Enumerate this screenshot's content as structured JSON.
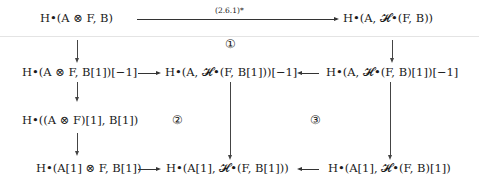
{
  "diagram": {
    "type": "commutative-diagram",
    "nodes": {
      "top_left": "H•(A ⊗ F, B)",
      "top_right": "H•(A, 𝓗•(F, B))",
      "mid_left": "H•(A ⊗ F, B[1])[−1]",
      "mid_center": "H•(A, 𝓗•(F, B[1]))[−1]",
      "mid_right": "H•(A, 𝓗•(F, B)[1])[−1]",
      "lower_left": "H•((A ⊗ F)[1], B[1])",
      "bottom_left": "H•(A[1] ⊗ F, B[1])",
      "bottom_center": "H•(A[1], 𝓗•(F, B[1]))",
      "bottom_right": "H•(A[1], 𝓗•(F, B)[1])"
    },
    "arrows": {
      "top_label": "(2.6.1)*"
    },
    "regions": {
      "r1": "①",
      "r2": "②",
      "r3": "③"
    }
  }
}
